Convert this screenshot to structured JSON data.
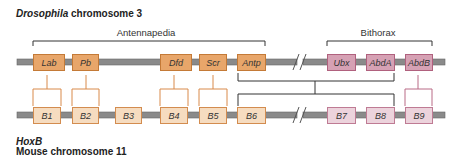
{
  "top_title": {
    "italic": "Drosophila",
    "rest": " chromosome 3"
  },
  "groups": [
    {
      "label": "Antennapedia",
      "x": 146
    },
    {
      "label": "Bithorax",
      "x": 378
    }
  ],
  "drosophila_genes": [
    {
      "label": "Lab",
      "x": 33,
      "w": 32,
      "kind": "orange"
    },
    {
      "label": "Pb",
      "x": 72,
      "w": 27,
      "kind": "orange"
    },
    {
      "label": "Dfd",
      "x": 160,
      "w": 32,
      "kind": "orange"
    },
    {
      "label": "Scr",
      "x": 199,
      "w": 28,
      "kind": "orange"
    },
    {
      "label": "Antp",
      "x": 237,
      "w": 29,
      "kind": "orange"
    },
    {
      "label": "Ubx",
      "x": 327,
      "w": 29,
      "kind": "pink"
    },
    {
      "label": "AbdA",
      "x": 366,
      "w": 29,
      "kind": "pink"
    },
    {
      "label": "AbdB",
      "x": 405,
      "w": 28,
      "kind": "pink"
    }
  ],
  "mouse_genes": [
    {
      "label": "B1",
      "x": 33,
      "w": 28,
      "kind": "lorange"
    },
    {
      "label": "B2",
      "x": 72,
      "w": 27,
      "kind": "lorange"
    },
    {
      "label": "B3",
      "x": 115,
      "w": 27,
      "kind": "lorange"
    },
    {
      "label": "B4",
      "x": 160,
      "w": 28,
      "kind": "lorange"
    },
    {
      "label": "B5",
      "x": 199,
      "w": 28,
      "kind": "lorange"
    },
    {
      "label": "B6",
      "x": 237,
      "w": 29,
      "kind": "lorange"
    },
    {
      "label": "B7",
      "x": 327,
      "w": 29,
      "kind": "lpink"
    },
    {
      "label": "B8",
      "x": 366,
      "w": 29,
      "kind": "lpink"
    },
    {
      "label": "B9",
      "x": 405,
      "w": 28,
      "kind": "lpink"
    }
  ],
  "bottom_title": {
    "line1": "HoxB",
    "line2": "Mouse chromosome 11"
  },
  "colors": {
    "orange": "#e8a66a",
    "pink": "#d6a1b4",
    "chromosome": "#8a8a8a",
    "connector_orange": "#d98a4a",
    "connector_pink": "#b96a86",
    "connector_dark": "#333333"
  }
}
